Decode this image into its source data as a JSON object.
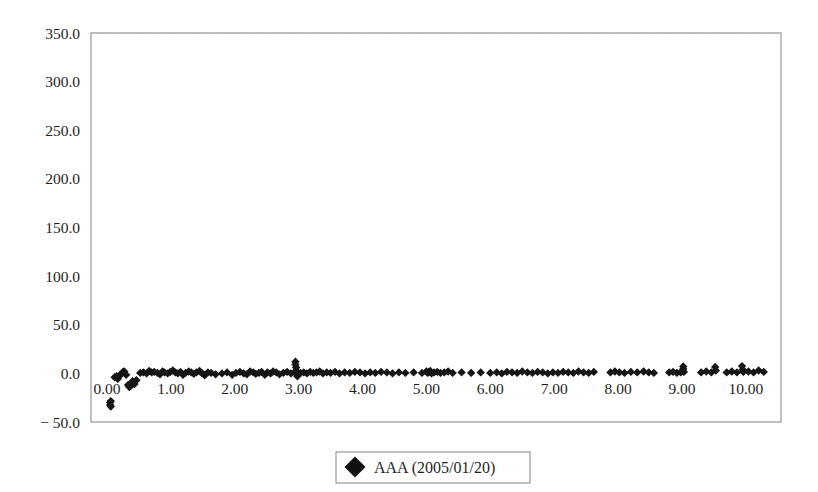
{
  "chart_data": {
    "type": "scatter",
    "title": "",
    "subtitle": "",
    "xlabel": "",
    "ylabel": "",
    "xlim": [
      -0.25,
      10.55
    ],
    "ylim": [
      -50.0,
      350.0
    ],
    "grid": true,
    "grid_axis": "y",
    "legend_position": "bottom-center",
    "y_ticks": [
      350.0,
      300.0,
      250.0,
      200.0,
      150.0,
      100.0,
      50.0,
      0.0,
      -50.0
    ],
    "y_tick_labels": [
      "350.0",
      "300.0",
      "250.0",
      "200.0",
      "150.0",
      "100.0",
      "50.0",
      "0.0",
      "− 50.0"
    ],
    "x_ticks": [
      0.0,
      1.0,
      2.0,
      3.0,
      4.0,
      5.0,
      6.0,
      7.0,
      8.0,
      9.0,
      10.0
    ],
    "x_tick_labels": [
      "0.00",
      "1.00",
      "2.00",
      "3.00",
      "4.00",
      "5.00",
      "6.00",
      "7.00",
      "8.00",
      "9.00",
      "10.00"
    ],
    "marker_shape": "diamond",
    "marker_color": "#111111",
    "marker_size": 4.6,
    "series": [
      {
        "name": "AAA (2005/01/20)",
        "color": "#111111",
        "points": [
          [
            0.05,
            -30.0
          ],
          [
            0.05,
            -32.5
          ],
          [
            0.06,
            -34.0
          ],
          [
            0.06,
            -28.5
          ],
          [
            0.12,
            -4.0
          ],
          [
            0.15,
            -3.0
          ],
          [
            0.17,
            -5.5
          ],
          [
            0.2,
            -2.0
          ],
          [
            0.22,
            -1.0
          ],
          [
            0.25,
            1.5
          ],
          [
            0.27,
            2.0
          ],
          [
            0.3,
            -1.5
          ],
          [
            0.33,
            -12.0
          ],
          [
            0.35,
            -14.0
          ],
          [
            0.37,
            -13.0
          ],
          [
            0.4,
            -8.0
          ],
          [
            0.43,
            -11.0
          ],
          [
            0.46,
            -7.0
          ],
          [
            0.52,
            0.5
          ],
          [
            0.57,
            1.0
          ],
          [
            0.62,
            0.0
          ],
          [
            0.66,
            2.5
          ],
          [
            0.7,
            1.0
          ],
          [
            0.74,
            1.5
          ],
          [
            0.79,
            0.5
          ],
          [
            0.83,
            -1.0
          ],
          [
            0.87,
            2.0
          ],
          [
            0.9,
            1.0
          ],
          [
            0.95,
            0.0
          ],
          [
            0.99,
            1.5
          ],
          [
            1.03,
            3.0
          ],
          [
            1.07,
            1.0
          ],
          [
            1.11,
            0.0
          ],
          [
            1.15,
            1.5
          ],
          [
            1.19,
            -1.5
          ],
          [
            1.23,
            0.5
          ],
          [
            1.28,
            2.0
          ],
          [
            1.32,
            1.0
          ],
          [
            1.36,
            -0.5
          ],
          [
            1.4,
            1.0
          ],
          [
            1.45,
            2.5
          ],
          [
            1.49,
            0.0
          ],
          [
            1.53,
            -2.0
          ],
          [
            1.58,
            1.0
          ],
          [
            1.63,
            0.5
          ],
          [
            1.7,
            -1.0
          ],
          [
            1.8,
            0.0
          ],
          [
            1.88,
            1.0
          ],
          [
            1.96,
            -1.5
          ],
          [
            2.02,
            0.5
          ],
          [
            2.08,
            1.5
          ],
          [
            2.14,
            0.0
          ],
          [
            2.19,
            -1.0
          ],
          [
            2.24,
            2.0
          ],
          [
            2.29,
            1.0
          ],
          [
            2.33,
            -0.5
          ],
          [
            2.38,
            0.5
          ],
          [
            2.42,
            1.5
          ],
          [
            2.47,
            -1.5
          ],
          [
            2.51,
            1.0
          ],
          [
            2.56,
            0.0
          ],
          [
            2.6,
            2.0
          ],
          [
            2.65,
            1.0
          ],
          [
            2.7,
            -1.0
          ],
          [
            2.76,
            0.5
          ],
          [
            2.82,
            1.5
          ],
          [
            2.88,
            0.0
          ],
          [
            2.95,
            12.0
          ],
          [
            2.95,
            9.0
          ],
          [
            2.96,
            6.0
          ],
          [
            2.96,
            3.0
          ],
          [
            2.97,
            1.0
          ],
          [
            2.97,
            -1.0
          ],
          [
            2.98,
            -3.0
          ],
          [
            3.03,
            0.5
          ],
          [
            3.08,
            1.0
          ],
          [
            3.13,
            0.0
          ],
          [
            3.18,
            1.5
          ],
          [
            3.23,
            0.5
          ],
          [
            3.28,
            1.0
          ],
          [
            3.33,
            2.0
          ],
          [
            3.38,
            0.0
          ],
          [
            3.44,
            1.0
          ],
          [
            3.5,
            0.5
          ],
          [
            3.57,
            1.5
          ],
          [
            3.64,
            0.0
          ],
          [
            3.72,
            1.0
          ],
          [
            3.8,
            0.5
          ],
          [
            3.88,
            1.5
          ],
          [
            3.96,
            1.0
          ],
          [
            4.04,
            0.0
          ],
          [
            4.12,
            1.0
          ],
          [
            4.2,
            0.5
          ],
          [
            4.29,
            1.5
          ],
          [
            4.38,
            1.0
          ],
          [
            4.47,
            0.0
          ],
          [
            4.57,
            1.0
          ],
          [
            4.67,
            0.5
          ],
          [
            4.8,
            1.0
          ],
          [
            4.93,
            0.5
          ],
          [
            5.0,
            2.0
          ],
          [
            5.02,
            0.5
          ],
          [
            5.04,
            1.5
          ],
          [
            5.06,
            2.5
          ],
          [
            5.08,
            0.0
          ],
          [
            5.12,
            1.0
          ],
          [
            5.17,
            1.5
          ],
          [
            5.22,
            0.5
          ],
          [
            5.28,
            1.0
          ],
          [
            5.34,
            2.0
          ],
          [
            5.41,
            0.5
          ],
          [
            5.55,
            1.0
          ],
          [
            5.7,
            0.5
          ],
          [
            5.85,
            1.0
          ],
          [
            6.0,
            0.5
          ],
          [
            6.1,
            1.0
          ],
          [
            6.18,
            0.0
          ],
          [
            6.26,
            1.5
          ],
          [
            6.34,
            1.0
          ],
          [
            6.42,
            0.5
          ],
          [
            6.5,
            2.0
          ],
          [
            6.58,
            1.0
          ],
          [
            6.66,
            0.5
          ],
          [
            6.74,
            1.5
          ],
          [
            6.82,
            1.0
          ],
          [
            6.9,
            0.0
          ],
          [
            6.98,
            1.0
          ],
          [
            7.06,
            0.5
          ],
          [
            7.14,
            1.5
          ],
          [
            7.22,
            1.0
          ],
          [
            7.3,
            0.5
          ],
          [
            7.38,
            2.0
          ],
          [
            7.46,
            1.0
          ],
          [
            7.54,
            0.5
          ],
          [
            7.62,
            1.5
          ],
          [
            7.88,
            1.0
          ],
          [
            7.95,
            2.0
          ],
          [
            8.02,
            1.0
          ],
          [
            8.1,
            0.5
          ],
          [
            8.2,
            1.5
          ],
          [
            8.3,
            1.0
          ],
          [
            8.4,
            2.0
          ],
          [
            8.48,
            1.0
          ],
          [
            8.56,
            0.5
          ],
          [
            8.8,
            1.0
          ],
          [
            8.86,
            1.5
          ],
          [
            8.92,
            0.5
          ],
          [
            8.98,
            1.0
          ],
          [
            9.02,
            7.0
          ],
          [
            9.02,
            4.5
          ],
          [
            9.03,
            1.5
          ],
          [
            9.3,
            1.0
          ],
          [
            9.38,
            2.0
          ],
          [
            9.46,
            1.0
          ],
          [
            9.52,
            6.5
          ],
          [
            9.53,
            3.0
          ],
          [
            9.7,
            1.0
          ],
          [
            9.78,
            2.0
          ],
          [
            9.86,
            1.0
          ],
          [
            9.94,
            7.5
          ],
          [
            9.95,
            4.0
          ],
          [
            9.96,
            1.5
          ],
          [
            10.04,
            2.0
          ],
          [
            10.12,
            1.0
          ],
          [
            10.2,
            3.0
          ],
          [
            10.28,
            1.5
          ]
        ]
      }
    ]
  },
  "legend": {
    "entries": [
      {
        "label": "AAA (2005/01/20)",
        "marker": "diamond-marker",
        "color": "#111111"
      }
    ]
  }
}
